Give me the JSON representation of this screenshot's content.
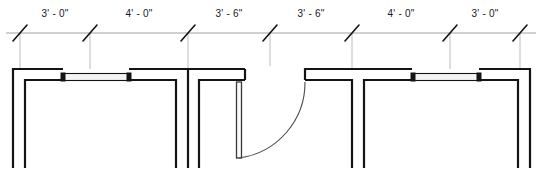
{
  "drawing": {
    "title": "Storefront Elevation Plan Detail",
    "type": "architectural-floor-plan",
    "units": "feet-inches",
    "background_color": "#ffffff",
    "line_color": "#1a1a1a",
    "thin_line_color": "#888888",
    "glazing_fill": "#f2f2f2"
  },
  "dimension_string": {
    "name": "overall-dimension-chain",
    "total_label": "22' - 0\"",
    "line_y": 33,
    "tick_style": "diagonal-slash",
    "ticks_x": [
      20,
      90,
      188,
      270,
      352,
      450,
      520
    ],
    "segments": [
      {
        "label": "3' - 0\"",
        "feet": 3,
        "inches": 0,
        "start_x": 20,
        "end_x": 90,
        "center_x": 55,
        "text_y": 16
      },
      {
        "label": "4' - 0\"",
        "feet": 4,
        "inches": 0,
        "start_x": 90,
        "end_x": 188,
        "center_x": 139,
        "text_y": 16
      },
      {
        "label": "3' - 6\"",
        "feet": 3,
        "inches": 6,
        "start_x": 188,
        "end_x": 270,
        "center_x": 229,
        "text_y": 16
      },
      {
        "label": "3' - 6\"",
        "feet": 3,
        "inches": 6,
        "start_x": 270,
        "end_x": 352,
        "center_x": 311,
        "text_y": 16
      },
      {
        "label": "4' - 0\"",
        "feet": 4,
        "inches": 0,
        "start_x": 352,
        "end_x": 450,
        "center_x": 401,
        "text_y": 16
      },
      {
        "label": "3' - 0\"",
        "feet": 3,
        "inches": 0,
        "start_x": 450,
        "end_x": 520,
        "center_x": 485,
        "text_y": 16
      }
    ]
  },
  "plan_elements": {
    "left_assembly": {
      "name": "left-storefront-assembly",
      "outer_wall_top_y": 69,
      "inner_wall_top_y": 81,
      "wall_bottom_y": 168,
      "left_edge_x": 12,
      "right_edge_x": 245
    },
    "right_assembly": {
      "name": "right-storefront-assembly",
      "outer_wall_top_y": 69,
      "inner_wall_top_y": 81,
      "wall_bottom_y": 168,
      "left_edge_x": 305,
      "right_edge_x": 530
    },
    "left_glazing_panel": {
      "name": "left-glazing-panel",
      "start_x": 62,
      "end_x": 130,
      "top_y": 74,
      "bottom_y": 80
    },
    "right_glazing_panel": {
      "name": "right-glazing-panel",
      "start_x": 412,
      "end_x": 480,
      "top_y": 74,
      "bottom_y": 80
    },
    "door": {
      "name": "swing-door",
      "hinge_x": 239,
      "hinge_y": 82,
      "leaf_width": 5,
      "leaf_length": 76,
      "swing_direction": "clockwise-right",
      "arc_radius": 76,
      "arc_end_x": 305,
      "arc_end_y": 82
    }
  }
}
